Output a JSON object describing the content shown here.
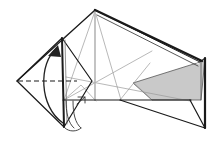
{
  "figure": {
    "title": "Origami fold step diagram",
    "type": "origami-folding-diagram",
    "canvas": {
      "width": 222,
      "height": 154,
      "background": "#ffffff"
    },
    "colors": {
      "outline": "#1a1a1a",
      "crease_light": "#9a9a9a",
      "crease_mid": "#6e6e6e",
      "shaded_face": "#c9c9c9",
      "shaded_face_edge": "#555555",
      "background": "#ffffff",
      "arrow": "#222222",
      "dashed_fold_line": "#1a1a1a"
    },
    "stroke_widths": {
      "outline": 1.2,
      "thick_edge": 2.2,
      "crease": 0.7,
      "dashed": 1.0,
      "arrow": 1.3
    },
    "shapes": {
      "apex": "95,10",
      "left_diamond_top": "62,38",
      "left_diamond_left": "17,81",
      "left_diamond_bottom": "64,127",
      "left_diamond_right": "92,81",
      "right_vertical_top": "205,58",
      "right_vertical_bottom": "205,128",
      "baseline_y": "100",
      "baseline_left_x": "64",
      "baseline_right_x": "190"
    },
    "outline_paths": {
      "main_body_left_edge": "M95,10 L17,81",
      "main_thick_ridge": "M95,10 L200,62",
      "right_panel": "M200,62 L205,58 L205,128 L190,100",
      "base_horizontal": "M64,100 L190,100",
      "lower_right_diagonal": "M120,100 L205,128",
      "left_diamond": "M62,38 L17,81 L64,127 L92,81 Z"
    },
    "shaded_face": {
      "points": "200,62 205,58 200,100 152,100 133,83",
      "fill": "#c9c9c9",
      "label": "gray-shaded-reverse-face"
    },
    "crease_lines": [
      {
        "name": "crease-apex-to-lower-left",
        "path": "M95,10 L64,100"
      },
      {
        "name": "crease-apex-to-mid",
        "path": "M95,10 L120,100"
      },
      {
        "name": "crease-apex-to-left-diamond",
        "path": "M95,10 L62,38"
      },
      {
        "name": "crease-vertical-center",
        "path": "M95,12 L95,102"
      },
      {
        "name": "crease-long-diagonal-right",
        "path": "M68,78 L190,100"
      },
      {
        "name": "crease-diagonal-up-right",
        "path": "M64,100 L150,52"
      },
      {
        "name": "crease-lower-left-vee",
        "path": "M64,100 L80,86 L95,100"
      },
      {
        "name": "crease-short-right",
        "path": "M152,100 L133,83"
      }
    ],
    "dashed_fold_line": {
      "name": "valley-fold-dashed-line",
      "path": "M18,81 L76,81",
      "dash_pattern": "5,3"
    },
    "fold_arrow": {
      "name": "curved-fold-arrow",
      "description": "curved arrow sweeping upward indicating fold direction",
      "path": "M62,122 C38,106 38,62 57,47",
      "arrowhead": "57,46 49,55 60,56"
    },
    "small_flap": {
      "name": "small-tab-flap",
      "paths": [
        "M66,99 C66,112 68,122 74,127",
        "M72,100 C72,112 74,122 80,127",
        "M66,127 C69,131 76,131 80,127",
        "M78,98 L84,98 L84,104",
        "M84,98 L78,104"
      ]
    },
    "thick_edges": [
      {
        "name": "ridge-edge-highlight",
        "path": "M95,10 L201,61"
      },
      {
        "name": "right-panel-edge",
        "path": "M205,58 L205,128"
      },
      {
        "name": "left-diamond-spine",
        "path": "M62,38 L64,127"
      }
    ]
  }
}
